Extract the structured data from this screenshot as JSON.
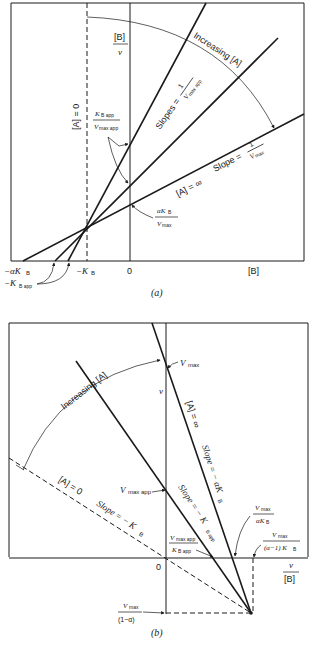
{
  "panel_a": {
    "caption": "(a)",
    "y_axis_label_num": "[B]",
    "y_axis_label_den": "v",
    "x_axis_label": "[B]",
    "origin_label": "0",
    "neg_kb": "−K",
    "neg_kb_sub": "B",
    "neg_alpha_kb": "−αK",
    "neg_alpha_kb_sub": "B",
    "neg_kbapp": "−K",
    "neg_kbapp_sub": "B app",
    "a_zero_label": "[A] = 0",
    "a_inf_label": "[A] = ∞",
    "increasing_label": "Increasing [A]",
    "slopes_label": "Slopes =",
    "slopes_num": "1",
    "slopes_den": "V",
    "slopes_den_sub": "max app",
    "slope_label": "Slope =",
    "slope_num": "1",
    "slope_den": "V",
    "slope_den_sub": "max",
    "kbapp_vmaxapp_num": "K",
    "kbapp_vmaxapp_num_sub": "B app",
    "kbapp_vmaxapp_den": "V",
    "kbapp_vmaxapp_den_sub": "max app",
    "alphakb_vmax_num": "αK",
    "alphakb_vmax_num_sub": "B",
    "alphakb_vmax_den": "V",
    "alphakb_vmax_den_sub": "max"
  },
  "panel_b": {
    "caption": "(b)",
    "y_axis_label": "v",
    "x_axis_label_num": "v",
    "x_axis_label_den": "[B]",
    "origin_label": "0",
    "vmax_label": "V",
    "vmax_sub": "max",
    "vmaxapp_label": "V",
    "vmaxapp_sub": "max app",
    "a_zero_label": "[A] = 0",
    "a_inf_label": "[A] = ∞",
    "increasing_label": "Increasing [A]",
    "slope_neg_kb": "Slope = − K",
    "slope_neg_kb_sub": "B",
    "slope_neg_kbapp": "Slope = − K",
    "slope_neg_kbapp_sub": "B app",
    "slope_neg_alphakb": "Slope = − αK",
    "slope_neg_alphakb_sub": "B",
    "vmaxapp_kbapp_num": "V",
    "vmaxapp_kbapp_num_sub": "max app",
    "vmaxapp_kbapp_den": "K",
    "vmaxapp_kbapp_den_sub": "B app",
    "vmax_alphakb_num": "V",
    "vmax_alphakb_num_sub": "max",
    "vmax_alphakb_den": "αK",
    "vmax_alphakb_den_sub": "B",
    "vmax_alpha1kb_num": "V",
    "vmax_alpha1kb_num_sub": "max",
    "vmax_alpha1kb_den": "(α−1) K",
    "vmax_alpha1kb_den_sub": "B",
    "vmax_1alpha_num": "V",
    "vmax_1alpha_num_sub": "max",
    "vmax_1alpha_den": "(1−α)"
  }
}
